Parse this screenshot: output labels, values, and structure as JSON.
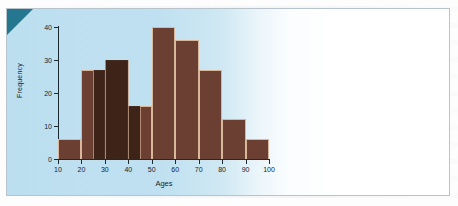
{
  "figure": {
    "panel_background": "#bcdff0",
    "corner_accent": "#25768f",
    "frame_border": "#b9c3cb"
  },
  "chart_data": {
    "type": "bar",
    "title": "",
    "subtitle": "",
    "xlabel": "Ages",
    "ylabel": "Frequency",
    "categories": [
      "10-20",
      "20-30",
      "30-40",
      "40-50",
      "50-60",
      "60-70",
      "70-80",
      "80-90",
      "90-100"
    ],
    "bin_edges": [
      10,
      20,
      30,
      40,
      50,
      60,
      70,
      80,
      90,
      100
    ],
    "values": [
      6,
      27,
      30,
      16,
      40,
      36,
      27,
      12,
      6
    ],
    "bar_color": "#6b3f31",
    "bar_color_dark": "#3b2117",
    "bar_edge_color": "#d8b79c",
    "xlim": [
      10,
      100
    ],
    "ylim": [
      0,
      40
    ],
    "xticks": [
      10,
      20,
      30,
      40,
      50,
      60,
      70,
      80,
      90,
      100
    ],
    "yticks": [
      0,
      10,
      20,
      30,
      40
    ],
    "xtick_labels": [
      "10",
      "20",
      "30",
      "40",
      "50",
      "60",
      "70",
      "80",
      "90",
      "100"
    ],
    "ytick_labels": [
      "0",
      "10",
      "20",
      "30",
      "40"
    ],
    "grid": false,
    "legend": null,
    "annotations": []
  }
}
